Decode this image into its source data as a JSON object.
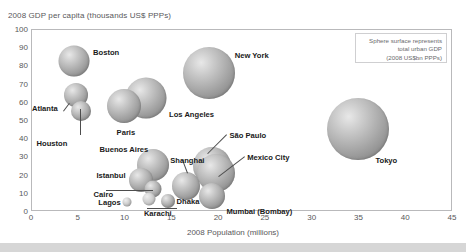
{
  "chart_data": {
    "type": "scatter",
    "title": "2008 GDP per capita (thousands US$ PPPs)",
    "xlabel": "2008 Population (millions)",
    "ylabel": "2008 GDP per capita (thousands US$ PPPs)",
    "xlim": [
      0,
      45
    ],
    "ylim": [
      0,
      100
    ],
    "xticks": [
      "0",
      "5",
      "10",
      "15",
      "20",
      "25",
      "30",
      "35",
      "40",
      "45"
    ],
    "yticks": [
      "0",
      "10",
      "20",
      "30",
      "40",
      "50",
      "60",
      "70",
      "80",
      "90",
      "100"
    ],
    "grid": false,
    "legend_position": "top-right",
    "size_encoding": "Sphere surface represents total urban GDP (2008 US$bn PPPs)",
    "points": [
      {
        "label": "Boston",
        "x": 4.6,
        "y": 82.5,
        "r": 15.5,
        "label_dx": 19,
        "label_dy": -13
      },
      {
        "label": "Atlanta",
        "x": 4.8,
        "y": 63.5,
        "r": 12.0,
        "label_dx": -44,
        "label_dy": 9
      },
      {
        "label": "Houston",
        "x": 5.3,
        "y": 55.0,
        "r": 10.0,
        "label_dx": -44,
        "label_dy": 28
      },
      {
        "label": "Paris",
        "x": 9.9,
        "y": 57.5,
        "r": 17.0,
        "label_dx": -7,
        "label_dy": 22
      },
      {
        "label": "Los Angeles",
        "x": 12.3,
        "y": 62.0,
        "r": 20.5,
        "label_dx": 23,
        "label_dy": 12
      },
      {
        "label": "New York",
        "x": 19.0,
        "y": 76.0,
        "r": 26.0,
        "label_dx": 26,
        "label_dy": -22
      },
      {
        "label": "Tokyo",
        "x": 35.0,
        "y": 45.0,
        "r": 31.0,
        "label_dx": 17,
        "label_dy": 27
      },
      {
        "label": "Buenos Aires",
        "x": 13.0,
        "y": 25.5,
        "r": 16.0,
        "label_dx": -53,
        "label_dy": -20
      },
      {
        "label": "Istanbul",
        "x": 11.8,
        "y": 17.0,
        "r": 12.0,
        "label_dx": -45,
        "label_dy": -9
      },
      {
        "label": "Cairo",
        "x": 13.0,
        "y": 12.0,
        "r": 8.5,
        "label_dx": -59,
        "label_dy": 1
      },
      {
        "label": "Shanghai",
        "x": 16.6,
        "y": 14.0,
        "r": 14.0,
        "label_dx": -16,
        "label_dy": -30
      },
      {
        "label": "São Paulo",
        "x": 19.4,
        "y": 25.0,
        "r": 19.0,
        "label_dx": 17,
        "label_dy": -35
      },
      {
        "label": "Mexico City",
        "x": 19.8,
        "y": 21.0,
        "r": 19.0,
        "label_dx": 31,
        "label_dy": -20
      },
      {
        "label": "Mumbai (Bombay)",
        "x": 19.4,
        "y": 8.0,
        "r": 13.0,
        "label_dx": 14,
        "label_dy": 11
      },
      {
        "label": "Dhaka",
        "x": 14.6,
        "y": 5.5,
        "r": 7.0,
        "label_dx": 9,
        "label_dy": -4
      },
      {
        "label": "Karachi",
        "x": 12.6,
        "y": 6.5,
        "r": 6.5,
        "label_dx": -5,
        "label_dy": 10
      },
      {
        "label": "Lagos",
        "x": 10.3,
        "y": 5.0,
        "r": 4.5,
        "label_dx": -29,
        "label_dy": -4
      }
    ]
  },
  "legend": {
    "line1": "Sphere surface represents",
    "line2": "total urban GDP",
    "line3": "(2008 US$bn PPPs)"
  }
}
